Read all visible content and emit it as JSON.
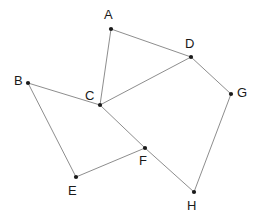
{
  "figure": {
    "width": 259,
    "height": 223,
    "background_color": "#ffffff",
    "edge_color": "#808080",
    "node_color": "#1a1a1a",
    "label_color": "#1a1a1a"
  },
  "graph": {
    "type": "undirected-node-link",
    "node_count": 8,
    "edge_count": 9,
    "nodes": [
      {
        "id": "A",
        "label": "A",
        "x": 111,
        "y": 29,
        "label_x": 104,
        "label_y": 8
      },
      {
        "id": "B",
        "label": "B",
        "x": 28,
        "y": 83,
        "label_x": 14,
        "label_y": 74
      },
      {
        "id": "C",
        "label": "C",
        "x": 100,
        "y": 105,
        "label_x": 85,
        "label_y": 89
      },
      {
        "id": "D",
        "label": "D",
        "x": 191,
        "y": 57,
        "label_x": 185,
        "label_y": 37
      },
      {
        "id": "E",
        "label": "E",
        "x": 76,
        "y": 177,
        "label_x": 68,
        "label_y": 184
      },
      {
        "id": "F",
        "label": "F",
        "x": 145,
        "y": 148,
        "label_x": 139,
        "label_y": 154
      },
      {
        "id": "G",
        "label": "G",
        "x": 231,
        "y": 94,
        "label_x": 237,
        "label_y": 86
      },
      {
        "id": "H",
        "label": "H",
        "x": 194,
        "y": 192,
        "label_x": 187,
        "label_y": 199
      }
    ],
    "edges": [
      {
        "source": "A",
        "target": "C"
      },
      {
        "source": "A",
        "target": "D"
      },
      {
        "source": "B",
        "target": "C"
      },
      {
        "source": "B",
        "target": "E"
      },
      {
        "source": "C",
        "target": "D"
      },
      {
        "source": "C",
        "target": "F"
      },
      {
        "source": "D",
        "target": "G"
      },
      {
        "source": "E",
        "target": "F"
      },
      {
        "source": "F",
        "target": "H"
      },
      {
        "source": "G",
        "target": "H"
      }
    ]
  }
}
